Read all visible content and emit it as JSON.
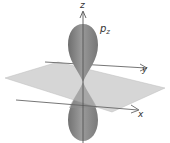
{
  "diagram": {
    "orbital_label": "p",
    "orbital_subscript": "z",
    "axes": {
      "z": "z",
      "y": "y",
      "x": "x"
    },
    "colors": {
      "lobe": "#8a8a8a",
      "lobe_shade": "#6f6f6f",
      "plane": "#c8c8c8",
      "axis": "#555555",
      "text": "#333333"
    }
  }
}
